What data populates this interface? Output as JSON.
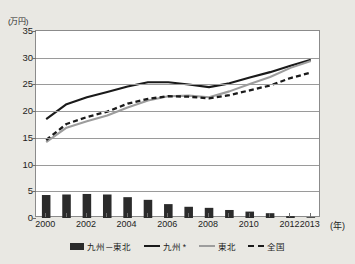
{
  "chart_data": {
    "type": "line",
    "title": "",
    "subtitle": "",
    "xlabel": "年",
    "ylabel": "(万円)",
    "unit_label": "(万円)",
    "year_unit": "(年)",
    "grid": true,
    "legend_position": "bottom",
    "xlim": [
      2000,
      2013
    ],
    "ylim": [
      0,
      35
    ],
    "yticks": [
      0,
      5,
      10,
      15,
      20,
      25,
      30,
      35
    ],
    "xticks": [
      2000,
      2002,
      2004,
      2006,
      2008,
      2010,
      2012,
      2013
    ],
    "x": [
      2000,
      2001,
      2002,
      2003,
      2004,
      2005,
      2006,
      2007,
      2008,
      2009,
      2010,
      2011,
      2012,
      2013
    ],
    "series": [
      {
        "name": "九州－東北",
        "type": "bar",
        "color": "#2b2b2b",
        "values": [
          4.3,
          4.4,
          4.5,
          4.4,
          3.9,
          3.4,
          2.6,
          2.1,
          1.9,
          1.5,
          1.2,
          0.9,
          0.35,
          0.15
        ]
      },
      {
        "name": "九州",
        "type": "line",
        "style": "solid",
        "color": "#1a1a1a",
        "values": [
          18.5,
          21.3,
          22.6,
          23.6,
          24.6,
          25.4,
          25.4,
          25.0,
          24.5,
          25.2,
          26.3,
          27.3,
          28.5,
          29.6
        ]
      },
      {
        "name": "東北",
        "type": "line",
        "style": "solid",
        "color": "#9d9d9d",
        "values": [
          14.2,
          16.9,
          18.1,
          19.2,
          20.7,
          22.0,
          22.8,
          22.9,
          22.6,
          23.7,
          25.1,
          26.4,
          28.1,
          29.4
        ]
      },
      {
        "name": "全国",
        "type": "line",
        "style": "dashed",
        "color": "#1a1a1a",
        "values": [
          14.6,
          17.6,
          18.9,
          19.9,
          21.4,
          22.3,
          22.8,
          22.7,
          22.4,
          23.0,
          23.9,
          24.8,
          26.2,
          27.2
        ]
      }
    ],
    "legend": [
      {
        "label": "九州－東北",
        "marker": "bar",
        "color": "#2b2b2b"
      },
      {
        "label": "九州 *",
        "marker": "line-solid",
        "color": "#1a1a1a"
      },
      {
        "label": "東北",
        "marker": "line-solid",
        "color": "#9d9d9d"
      },
      {
        "label": "全国",
        "marker": "line-dashed",
        "color": "#1a1a1a"
      }
    ]
  }
}
